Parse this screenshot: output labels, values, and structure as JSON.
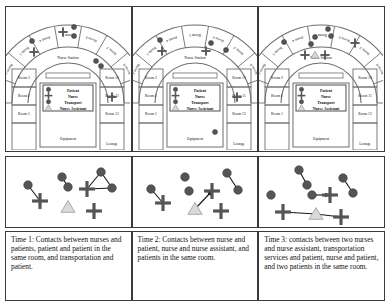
{
  "figure": {
    "panel_count": 3,
    "ward_name": "Nurse Station"
  },
  "legend": {
    "title": "",
    "items": [
      {
        "symbol": "circle",
        "label": "Patient"
      },
      {
        "symbol": "cross",
        "label": "Nurse"
      },
      {
        "symbol": "circle",
        "label": "Transport"
      },
      {
        "symbol": "triangle",
        "label": "Nurse Assistant"
      }
    ]
  },
  "floorplan": {
    "center_label": "Nurse Station",
    "arc_rooms": [
      "Room 1",
      "Room 2",
      "Room 3",
      "Room 4",
      "Room 5",
      "Room 6",
      "Room 7",
      "Room 8",
      "Room 9"
    ],
    "arc_rooms_visible": [
      "Room 3",
      "Room 4",
      "Room 5",
      "Room 6",
      "Room 7",
      "Room 8"
    ],
    "left_rooms": [
      "Room 3",
      "Room 2",
      "Room 1"
    ],
    "right_rooms": [
      "Room 10",
      "Room 11",
      "Room 12"
    ],
    "bottom_left_label": "Equipment",
    "bottom_right_label": "Lounge"
  },
  "panels": [
    {
      "id": "time-1",
      "caption": "Time 1: Contacts between nurses and patients, patient and patient in the same room, and transportation and patient.",
      "plan_markers": [
        {
          "type": "circle",
          "x": 26,
          "y": 34
        },
        {
          "type": "cross",
          "x": 28,
          "y": 45
        },
        {
          "type": "cross",
          "x": 57,
          "y": 25
        },
        {
          "type": "circle",
          "x": 68,
          "y": 20
        },
        {
          "type": "circle",
          "x": 68,
          "y": 29
        },
        {
          "type": "circle",
          "x": 90,
          "y": 54
        },
        {
          "type": "circle",
          "x": 95,
          "y": 59
        },
        {
          "type": "cross",
          "x": 106,
          "y": 90
        }
      ],
      "network": {
        "nodes": [
          {
            "id": "n1",
            "type": "circle",
            "x": 22,
            "y": 28
          },
          {
            "id": "n2",
            "type": "cross",
            "x": 34,
            "y": 44
          },
          {
            "id": "n3",
            "type": "circle",
            "x": 56,
            "y": 20
          },
          {
            "id": "n4",
            "type": "circle",
            "x": 62,
            "y": 30
          },
          {
            "id": "n5",
            "type": "circle",
            "x": 95,
            "y": 15
          },
          {
            "id": "n6",
            "type": "cross",
            "x": 81,
            "y": 32
          },
          {
            "id": "n7",
            "type": "circle",
            "x": 106,
            "y": 31
          },
          {
            "id": "n8",
            "type": "triangle",
            "x": 62,
            "y": 50
          },
          {
            "id": "n9",
            "type": "cross",
            "x": 88,
            "y": 54
          }
        ],
        "edges": [
          {
            "from": "n1",
            "to": "n2",
            "arrow": false
          },
          {
            "from": "n3",
            "to": "n4",
            "arrow": false
          },
          {
            "from": "n5",
            "to": "n6",
            "arrow": false
          },
          {
            "from": "n5",
            "to": "n7",
            "arrow": false
          },
          {
            "from": "n6",
            "to": "n7",
            "arrow": false
          }
        ]
      }
    },
    {
      "id": "time-2",
      "caption": "Time 2: Contacts between nurse and patient, nurse and nurse assistant, and patients in the same room.",
      "plan_markers": [
        {
          "type": "circle",
          "x": 27,
          "y": 33
        },
        {
          "type": "cross",
          "x": 29,
          "y": 44
        },
        {
          "type": "cross",
          "x": 73,
          "y": 44
        },
        {
          "type": "circle",
          "x": 78,
          "y": 36
        },
        {
          "type": "circle",
          "x": 93,
          "y": 43
        },
        {
          "type": "cross",
          "x": 104,
          "y": 90
        },
        {
          "type": "circle",
          "x": 82,
          "y": 125
        }
      ],
      "network": {
        "nodes": [
          {
            "id": "m1",
            "type": "circle",
            "x": 18,
            "y": 32
          },
          {
            "id": "m2",
            "type": "cross",
            "x": 30,
            "y": 46
          },
          {
            "id": "m3",
            "type": "circle",
            "x": 52,
            "y": 20
          },
          {
            "id": "m4",
            "type": "circle",
            "x": 56,
            "y": 34
          },
          {
            "id": "m5",
            "type": "circle",
            "x": 94,
            "y": 16
          },
          {
            "id": "m6",
            "type": "circle",
            "x": 105,
            "y": 33
          },
          {
            "id": "m7",
            "type": "triangle",
            "x": 62,
            "y": 52
          },
          {
            "id": "m8",
            "type": "cross",
            "x": 79,
            "y": 34
          },
          {
            "id": "m9",
            "type": "cross",
            "x": 88,
            "y": 54
          }
        ],
        "edges": [
          {
            "from": "m1",
            "to": "m2",
            "arrow": false
          },
          {
            "from": "m5",
            "to": "m6",
            "arrow": false
          },
          {
            "from": "m7",
            "to": "m8",
            "arrow": true
          }
        ]
      }
    },
    {
      "id": "time-3",
      "caption": "Time 3: contacts between two nurses and nurse assistant, transportation services and patient, nurse and patient, and two patients in the same room.",
      "plan_markers": [
        {
          "type": "circle",
          "x": 25,
          "y": 35
        },
        {
          "type": "circle",
          "x": 52,
          "y": 37
        },
        {
          "type": "circle",
          "x": 56,
          "y": 30
        },
        {
          "type": "circle",
          "x": 69,
          "y": 22
        },
        {
          "type": "circle",
          "x": 72,
          "y": 29
        },
        {
          "type": "cross",
          "x": 46,
          "y": 48
        },
        {
          "type": "cross",
          "x": 66,
          "y": 48
        },
        {
          "type": "triangle",
          "x": 56,
          "y": 48
        },
        {
          "type": "cross",
          "x": 96,
          "y": 36
        }
      ],
      "network": {
        "nodes": [
          {
            "id": "p1",
            "type": "circle",
            "x": 40,
            "y": 13
          },
          {
            "id": "p2",
            "type": "circle",
            "x": 48,
            "y": 28
          },
          {
            "id": "p3",
            "type": "circle",
            "x": 84,
            "y": 21
          },
          {
            "id": "p4",
            "type": "circle",
            "x": 94,
            "y": 36
          },
          {
            "id": "p5",
            "type": "circle",
            "x": 12,
            "y": 38
          },
          {
            "id": "p6",
            "type": "circle",
            "x": 53,
            "y": 38
          },
          {
            "id": "p7",
            "type": "cross",
            "x": 71,
            "y": 38
          },
          {
            "id": "p8",
            "type": "cross",
            "x": 24,
            "y": 55
          },
          {
            "id": "p9",
            "type": "triangle",
            "x": 57,
            "y": 57
          },
          {
            "id": "p10",
            "type": "cross",
            "x": 82,
            "y": 60
          }
        ],
        "edges": [
          {
            "from": "p1",
            "to": "p2",
            "arrow": false
          },
          {
            "from": "p3",
            "to": "p4",
            "arrow": false
          },
          {
            "from": "p6",
            "to": "p7",
            "arrow": true
          },
          {
            "from": "p8",
            "to": "p9",
            "arrow": false
          },
          {
            "from": "p9",
            "to": "p10",
            "arrow": false
          }
        ]
      }
    }
  ],
  "colors": {
    "node_fill": "#555555",
    "node_stroke": "#333333",
    "triangle_fill": "#d9d9d9",
    "triangle_stroke": "#9a9a9a",
    "edge": "#1a1a1a",
    "wall": "#6e6e6e",
    "border": "#3a3a3a",
    "text": "#111111",
    "background": "#ffffff"
  }
}
